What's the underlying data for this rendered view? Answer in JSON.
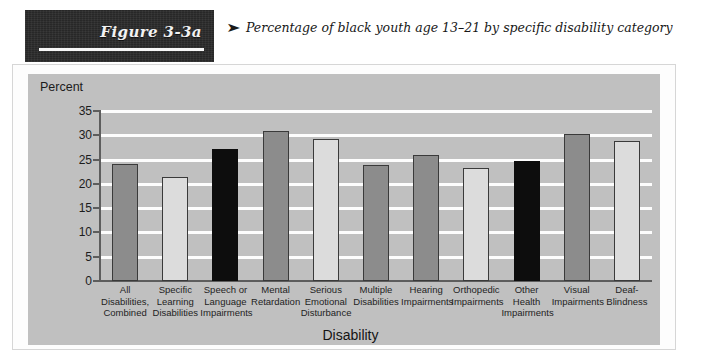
{
  "header": {
    "figure_label": "Figure 3-3a",
    "caption_arrow": "➤",
    "caption": "Percentage of black youth age 13–21 by specific disability category"
  },
  "chart_data": {
    "type": "bar",
    "title": "",
    "subtitle": "",
    "xlabel": "Disability",
    "ylabel": "Percent",
    "ylim": [
      0,
      35
    ],
    "ytick_labels": [
      "0",
      "5",
      "10",
      "15",
      "20",
      "25",
      "30",
      "35"
    ],
    "ytick_values": [
      0,
      5,
      10,
      15,
      20,
      25,
      30,
      35
    ],
    "grid": true,
    "grid_color": "#fdfdfd",
    "plot_background": "#c0c0c0",
    "legend": null,
    "categories": [
      "All Disabilities, Combined",
      "Specific Learning Disabilities",
      "Speech or Language Impairments",
      "Mental Retardation",
      "Serious Emotional Disturbance",
      "Multiple Disabilities",
      "Hearing Impairments",
      "Orthopedic Impairments",
      "Other Health Impairments",
      "Visual Impairments",
      "Deaf-Blindness"
    ],
    "category_lines": [
      [
        "All",
        "Disabilities,",
        "Combined"
      ],
      [
        "Specific",
        "Learning",
        "Disabilities"
      ],
      [
        "Speech or",
        "Language",
        "Impairments"
      ],
      [
        "Mental",
        "Retardation"
      ],
      [
        "Serious",
        "Emotional",
        "Disturbance"
      ],
      [
        "Multiple",
        "Disabilities"
      ],
      [
        "Hearing",
        "Impairments"
      ],
      [
        "Orthopedic",
        "Impairments"
      ],
      [
        "Other",
        "Health",
        "Impairments"
      ],
      [
        "Visual",
        "Impairments"
      ],
      [
        "Deaf-",
        "Blindness"
      ]
    ],
    "values": [
      24.0,
      21.5,
      27.2,
      30.8,
      29.3,
      23.8,
      26.0,
      23.3,
      24.7,
      30.3,
      28.8
    ],
    "bar_styles": [
      "gray",
      "light",
      "black",
      "gray",
      "light",
      "gray",
      "gray",
      "light",
      "black",
      "gray",
      "light"
    ],
    "style_colors": {
      "gray": "#8c8c8c",
      "light": "#dcdcdc",
      "black": "#0d0d0d",
      "outline": "#3a3a3a"
    }
  }
}
